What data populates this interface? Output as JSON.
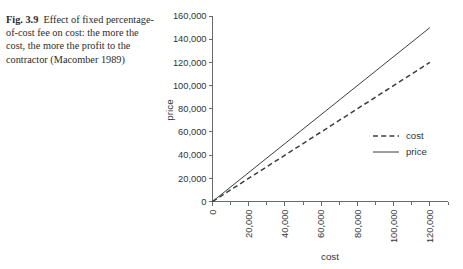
{
  "caption": {
    "label": "Fig. 3.9",
    "text": "Effect of fixed percentage-of-cost fee on cost: the more the cost, the more the profit to the contractor (Macomber 1989)"
  },
  "chart_data": {
    "type": "line",
    "title": "",
    "xlabel": "cost",
    "ylabel": "price",
    "xlim": [
      0,
      130000
    ],
    "ylim": [
      0,
      160000
    ],
    "grid": false,
    "legend_position": "right",
    "x_tick_labels": [
      "0",
      "20,000",
      "40,000",
      "60,000",
      "80,000",
      "100,000",
      "120,000"
    ],
    "x_tick_values": [
      0,
      20000,
      40000,
      60000,
      80000,
      100000,
      120000
    ],
    "x_minor_tick_values": [
      10000,
      30000,
      50000,
      70000,
      90000,
      110000,
      130000
    ],
    "y_tick_labels": [
      "0",
      "20,000",
      "40,000",
      "60,000",
      "80,000",
      "100,000",
      "120,000",
      "140,000",
      "160,000"
    ],
    "y_tick_values": [
      0,
      20000,
      40000,
      60000,
      80000,
      100000,
      120000,
      140000,
      160000
    ],
    "x": [
      0,
      120000
    ],
    "series": [
      {
        "name": "cost",
        "style": "dashed",
        "color": "#3a3f3f",
        "values": [
          0,
          120000
        ]
      },
      {
        "name": "price",
        "style": "solid",
        "color": "#3a3f3f",
        "values": [
          0,
          150000
        ]
      }
    ]
  }
}
